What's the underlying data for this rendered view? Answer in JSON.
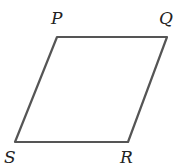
{
  "diagram": {
    "type": "parallelogram",
    "stroke_color": "#555555",
    "vertices": [
      {
        "label": "P",
        "x": 57,
        "y": 37
      },
      {
        "label": "Q",
        "x": 167,
        "y": 37
      },
      {
        "label": "R",
        "x": 128,
        "y": 142
      },
      {
        "label": "S",
        "x": 15,
        "y": 142
      }
    ]
  }
}
